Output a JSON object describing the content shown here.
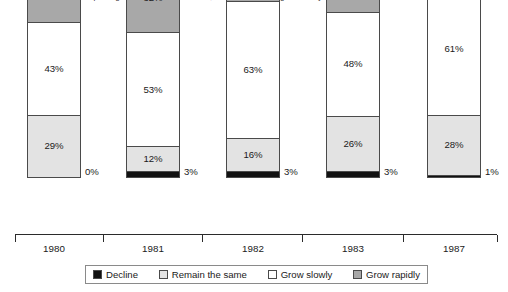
{
  "chart_data": {
    "type": "bar",
    "subtype": "stacked-bar-100",
    "title": "Percentage of issues expecting their business to decline, remain the same, grow slowly or grow rapidly",
    "xlabel": "",
    "ylabel": "",
    "ylim": [
      0,
      100
    ],
    "grid": false,
    "legend_position": "bottom",
    "categories": [
      "1980",
      "1981",
      "1982",
      "1983",
      "1987"
    ],
    "series": [
      {
        "name": "Decline",
        "color": "#111111",
        "values": [
          0,
          3,
          3,
          3,
          1
        ]
      },
      {
        "name": "Remain the same",
        "color": "#e3e3e3",
        "values": [
          29,
          12,
          16,
          26,
          28
        ]
      },
      {
        "name": "Grow slowly",
        "color": "#ffffff",
        "values": [
          43,
          53,
          63,
          48,
          61
        ]
      },
      {
        "name": "Grow rapidly",
        "color": "#a8a8a8",
        "values": [
          28,
          32,
          18,
          23,
          10
        ]
      }
    ],
    "bars": [
      {
        "category": "1980",
        "segments": [
          {
            "key": "rapidly",
            "label": "28%",
            "value": 28,
            "inside": true
          },
          {
            "key": "slowly",
            "label": "43%",
            "value": 43,
            "inside": true
          },
          {
            "key": "remain",
            "label": "29%",
            "value": 29,
            "inside": true
          },
          {
            "key": "decline",
            "label": "0%",
            "value": 0,
            "inside": false
          }
        ]
      },
      {
        "category": "1981",
        "segments": [
          {
            "key": "rapidly",
            "label": "32%",
            "value": 32,
            "inside": true
          },
          {
            "key": "slowly",
            "label": "53%",
            "value": 53,
            "inside": true
          },
          {
            "key": "remain",
            "label": "12%",
            "value": 12,
            "inside": true
          },
          {
            "key": "decline",
            "label": "3%",
            "value": 3,
            "inside": false
          }
        ]
      },
      {
        "category": "1982",
        "segments": [
          {
            "key": "rapidly",
            "label": "18%",
            "value": 18,
            "inside": true
          },
          {
            "key": "slowly",
            "label": "63%",
            "value": 63,
            "inside": true
          },
          {
            "key": "remain",
            "label": "16%",
            "value": 16,
            "inside": true
          },
          {
            "key": "decline",
            "label": "3%",
            "value": 3,
            "inside": false
          }
        ]
      },
      {
        "category": "1983",
        "segments": [
          {
            "key": "rapidly",
            "label": "23%",
            "value": 23,
            "inside": true
          },
          {
            "key": "slowly",
            "label": "48%",
            "value": 48,
            "inside": true
          },
          {
            "key": "remain",
            "label": "26%",
            "value": 26,
            "inside": true
          },
          {
            "key": "decline",
            "label": "3%",
            "value": 3,
            "inside": false
          }
        ]
      },
      {
        "category": "1987",
        "segments": [
          {
            "key": "rapidly",
            "label": "10%",
            "value": 10,
            "inside": true
          },
          {
            "key": "slowly",
            "label": "61%",
            "value": 61,
            "inside": true
          },
          {
            "key": "remain",
            "label": "28%",
            "value": 28,
            "inside": true
          },
          {
            "key": "decline",
            "label": "1%",
            "value": 1,
            "inside": false
          }
        ]
      }
    ]
  },
  "legend": {
    "items": [
      {
        "label": "Decline",
        "key": "decline",
        "color": "#111111"
      },
      {
        "label": "Remain the same",
        "key": "remain",
        "color": "#e3e3e3"
      },
      {
        "label": "Grow slowly",
        "key": "slowly",
        "color": "#ffffff"
      },
      {
        "label": "Grow rapidly",
        "key": "rapidly",
        "color": "#a8a8a8"
      }
    ]
  }
}
